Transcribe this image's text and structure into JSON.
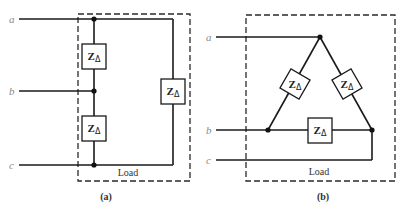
{
  "figure": {
    "a": {
      "caption": "(a)",
      "load_label": "Load",
      "terminals": [
        "a",
        "b",
        "c"
      ],
      "impedances": [
        {
          "symbol": "Z",
          "subscript": "Δ",
          "position": "between a and b"
        },
        {
          "symbol": "Z",
          "subscript": "Δ",
          "position": "between b and c"
        },
        {
          "symbol": "Z",
          "subscript": "Δ",
          "position": "between a and c"
        }
      ]
    },
    "b": {
      "caption": "(b)",
      "load_label": "Load",
      "terminals": [
        "a",
        "b",
        "c"
      ],
      "impedances": [
        {
          "symbol": "Z",
          "subscript": "Δ",
          "position": "left side of triangle (a-b)"
        },
        {
          "symbol": "Z",
          "subscript": "Δ",
          "position": "right side of triangle (a-c)"
        },
        {
          "symbol": "Z",
          "subscript": "Δ",
          "position": "bottom of triangle (b-c)"
        }
      ]
    }
  }
}
